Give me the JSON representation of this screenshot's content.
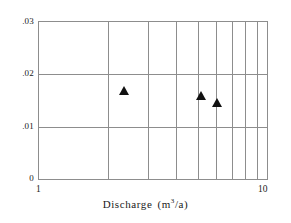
{
  "chart_data": {
    "type": "scatter",
    "title": "",
    "xlabel": "Discharge  (m³/a)",
    "xlabel_text": "Discharge",
    "xlabel_unit_prefix": "(m",
    "xlabel_unit_sup": "3",
    "xlabel_unit_suffix": "/a)",
    "ylabel": "",
    "xscale": "log",
    "yscale": "linear",
    "xlim": [
      1,
      10
    ],
    "ylim": [
      0,
      0.03
    ],
    "grid": true,
    "legend": false,
    "xticks": [
      1,
      10
    ],
    "xtick_labels": [
      "1",
      "10"
    ],
    "xgridlines": [
      2,
      3,
      4,
      5,
      6,
      7,
      8,
      9
    ],
    "yticks": [
      0,
      0.01,
      0.02,
      0.03
    ],
    "ytick_labels": [
      "0",
      ".01",
      ".02",
      ".03"
    ],
    "ygridlines": [
      0.01,
      0.02
    ],
    "marker": "filled-triangle",
    "marker_color": "#111111",
    "frame_color": "#8d8d8d",
    "points": [
      {
        "x": 2.35,
        "y": 0.0166
      },
      {
        "x": 5.15,
        "y": 0.0157
      },
      {
        "x": 6.05,
        "y": 0.0143
      }
    ]
  },
  "axis": {
    "ytick_0": "0",
    "ytick_1": ".01",
    "ytick_2": ".02",
    "ytick_3": ".03",
    "xtick_min": "1",
    "xtick_max": "10"
  }
}
